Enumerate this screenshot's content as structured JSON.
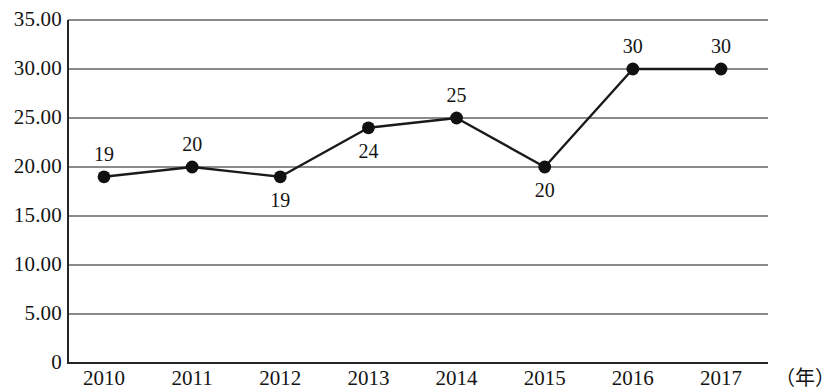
{
  "chart_data": {
    "type": "line",
    "title": "",
    "subtitle": "",
    "xlabel": "（年）",
    "ylabel": "",
    "categories": [
      "2010",
      "2011",
      "2012",
      "2013",
      "2014",
      "2015",
      "2016",
      "2017"
    ],
    "values": [
      19,
      20,
      19,
      24,
      25,
      20,
      30,
      30
    ],
    "point_labels": [
      "19",
      "20",
      "19",
      "24",
      "25",
      "20",
      "30",
      "30"
    ],
    "label_positions": [
      "above",
      "above",
      "below",
      "below",
      "above",
      "below",
      "above",
      "above"
    ],
    "ylim": [
      0,
      35
    ],
    "ytick_labels": [
      "35.00",
      "30.00",
      "25.00",
      "20.00",
      "15.00",
      "10.00",
      "5.00",
      "0"
    ],
    "ytick_values": [
      35,
      30,
      25,
      20,
      15,
      10,
      5,
      0
    ],
    "grid": true,
    "grid_axis": "y",
    "legend": false,
    "legend_position": "none",
    "series": [
      {
        "name": "",
        "values": [
          19,
          20,
          19,
          24,
          25,
          20,
          30,
          30
        ],
        "line_color": "#1a1a1a",
        "marker": "circle",
        "marker_color": "#111111"
      }
    ],
    "colors": {
      "line": "#1a1a1a",
      "marker": "#111111",
      "grid": "#8a8a8a",
      "axis": "#262626",
      "text": "#141414",
      "background": "#ffffff"
    }
  },
  "axes": {
    "y_labels": [
      {
        "text": "35.00",
        "value": 35
      },
      {
        "text": "30.00",
        "value": 30
      },
      {
        "text": "25.00",
        "value": 25
      },
      {
        "text": "20.00",
        "value": 20
      },
      {
        "text": "15.00",
        "value": 15
      },
      {
        "text": "10.00",
        "value": 10
      },
      {
        "text": "5.00",
        "value": 5
      },
      {
        "text": "0",
        "value": 0
      }
    ],
    "x_labels": [
      {
        "text": "2010"
      },
      {
        "text": "2011"
      },
      {
        "text": "2012"
      },
      {
        "text": "2013"
      },
      {
        "text": "2014"
      },
      {
        "text": "2015"
      },
      {
        "text": "2016"
      },
      {
        "text": "2017"
      }
    ],
    "x_unit": "（年）"
  }
}
